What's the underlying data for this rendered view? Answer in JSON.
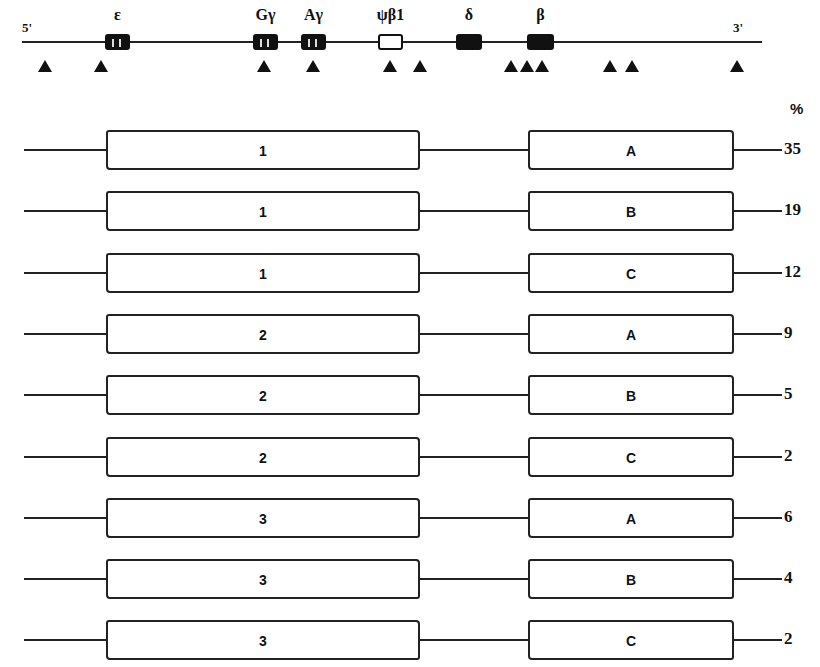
{
  "locus": {
    "end_5_label": "5'",
    "end_3_label": "3'",
    "genes": [
      {
        "label": "ε",
        "x": 105,
        "width": 25,
        "type": "gene",
        "stripes": [
          112,
          119
        ]
      },
      {
        "label": "Gγ",
        "x": 253,
        "width": 25,
        "type": "gene",
        "stripes": [
          260,
          267
        ]
      },
      {
        "label": "Aγ",
        "x": 301,
        "width": 25,
        "type": "gene",
        "stripes": [
          308,
          315
        ]
      },
      {
        "label": "ψβ1",
        "x": 378,
        "width": 25,
        "type": "pseudogene",
        "stripes": []
      },
      {
        "label": "δ",
        "x": 456,
        "width": 26,
        "type": "gene",
        "stripes": []
      },
      {
        "label": "β",
        "x": 527,
        "width": 27,
        "type": "gene",
        "stripes": []
      }
    ],
    "restriction_sites_x": [
      45,
      101,
      264,
      313,
      390,
      420,
      511,
      527,
      542,
      610,
      632,
      737
    ]
  },
  "haplotypes": {
    "percent_header": "%",
    "rows": [
      {
        "left_haplotype": "1",
        "right_haplotype": "A",
        "percent": "35"
      },
      {
        "left_haplotype": "1",
        "right_haplotype": "B",
        "percent": "19"
      },
      {
        "left_haplotype": "1",
        "right_haplotype": "C",
        "percent": "12"
      },
      {
        "left_haplotype": "2",
        "right_haplotype": "A",
        "percent": "9"
      },
      {
        "left_haplotype": "2",
        "right_haplotype": "B",
        "percent": "5"
      },
      {
        "left_haplotype": "2",
        "right_haplotype": "C",
        "percent": "2"
      },
      {
        "left_haplotype": "3",
        "right_haplotype": "A",
        "percent": "6"
      },
      {
        "left_haplotype": "3",
        "right_haplotype": "B",
        "percent": "4"
      },
      {
        "left_haplotype": "3",
        "right_haplotype": "C",
        "percent": "2"
      }
    ]
  }
}
